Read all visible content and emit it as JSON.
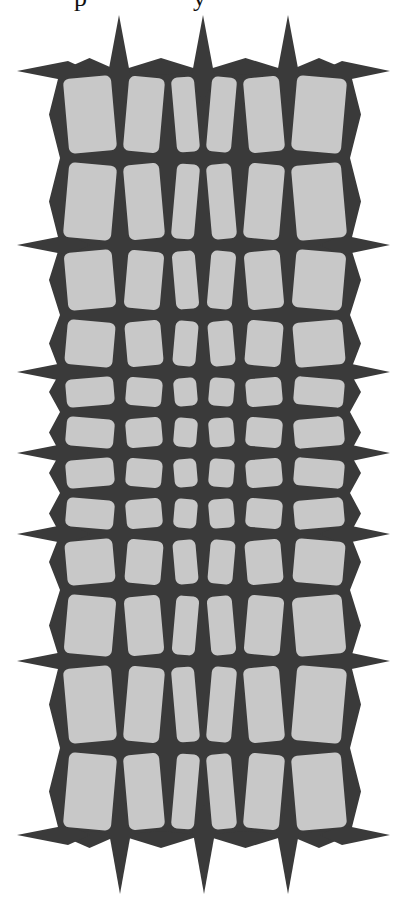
{
  "figure": {
    "caption_fragment": {
      "visible": true,
      "glyphs": [
        {
          "char": "p",
          "x": 74
        },
        {
          "char": "y",
          "x": 193
        }
      ],
      "note": "cropped descenders only"
    },
    "colors": {
      "background": "#ffffff",
      "cut_material": "#3a3a3a",
      "tile": "#c8c8c8"
    },
    "grid": {
      "columns": 6,
      "rows": 12,
      "col_bounds": [
        60,
        120,
        168,
        203,
        240,
        288,
        350
      ],
      "row_bounds": [
        71,
        158,
        245,
        315,
        372,
        412,
        453,
        493,
        534,
        590,
        661,
        748,
        835
      ],
      "tile_gap": 6,
      "tile_corner_radius": 6,
      "rotation_deg": 5
    },
    "spikes": {
      "top_tips": [
        [
          119,
          15
        ],
        [
          203,
          15
        ],
        [
          288,
          15
        ]
      ],
      "bottom_tips": [
        [
          120,
          894
        ],
        [
          204,
          894
        ],
        [
          288,
          894
        ]
      ],
      "left_tips_y": [
        71,
        245,
        372,
        453,
        534,
        661,
        835
      ],
      "right_tips_y": [
        71,
        245,
        372,
        453,
        534,
        661,
        835
      ],
      "left_tip_x": 17,
      "right_tip_x": 390
    }
  }
}
